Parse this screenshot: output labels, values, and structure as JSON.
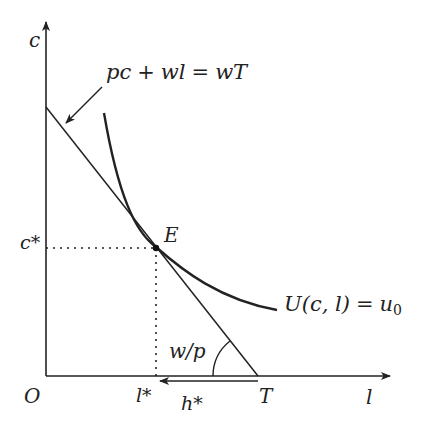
{
  "diagram": {
    "axes": {
      "y_label": "c",
      "x_label": "l",
      "origin_label": "O"
    },
    "budget_line": {
      "label": "pc + wl = wT",
      "label_parts": {
        "a": "pc",
        "plus": "+",
        "b": "wl",
        "eq": "=",
        "c": "wT"
      },
      "x_intercept_label": "T",
      "slope_angle_label": "w/p"
    },
    "indifference_curve": {
      "label_parts": {
        "U": "U",
        "args": "(c, l)",
        "eq": "=",
        "u": "u",
        "sub": "0"
      }
    },
    "equilibrium": {
      "point_label": "E",
      "c_star_label": "c*",
      "l_star_label": "l*",
      "h_star_label": "h*"
    },
    "colors": {
      "line": "#222222",
      "background": "#ffffff"
    }
  }
}
